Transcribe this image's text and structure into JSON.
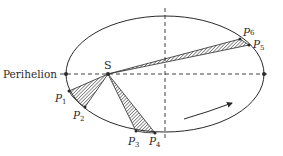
{
  "diagram": {
    "labels": {
      "perihelion": "Perihelion",
      "sun": "S",
      "p1": "P",
      "p1_sub": "1",
      "p2": "P",
      "p2_sub": "2",
      "p3": "P",
      "p3_sub": "3",
      "p4": "P",
      "p4_sub": "4",
      "p5": "P",
      "p5_sub": "5",
      "p6": "P",
      "p6_sub": "6"
    },
    "ellipse": {
      "cx": 165,
      "cy": 74,
      "rx": 99,
      "ry": 58
    },
    "colors": {
      "stroke": "#2a2a2a",
      "hatch": "#3a3a3a",
      "background": "#ffffff"
    },
    "arrow_direction": "counterclockwise motion indicator"
  }
}
